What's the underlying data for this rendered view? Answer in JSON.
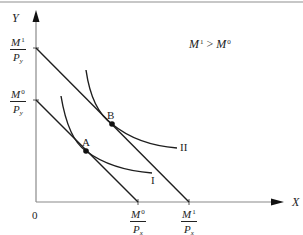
{
  "diagram": {
    "type": "indifference-curve budget-line diagram",
    "axes": {
      "x_label": "X",
      "y_label": "Y",
      "origin_label": "0"
    },
    "annotation": {
      "text_left": "M",
      "sup_left": "1",
      "relation": " > ",
      "text_right": "M",
      "sup_right": "0"
    },
    "y_intercepts": [
      {
        "num": "M",
        "num_sup": "0",
        "den": "P",
        "den_sub": "y"
      },
      {
        "num": "M",
        "num_sup": "1",
        "den": "P",
        "den_sub": "y"
      }
    ],
    "x_intercepts": [
      {
        "num": "M",
        "num_sup": "0",
        "den": "P",
        "den_sub": "x"
      },
      {
        "num": "M",
        "num_sup": "1",
        "den": "P",
        "den_sub": "x"
      }
    ],
    "points": [
      {
        "label": "A"
      },
      {
        "label": "B"
      }
    ],
    "curves": [
      {
        "label": "I"
      },
      {
        "label": "II"
      }
    ],
    "colors": {
      "axis": "#8a8a8a",
      "lines": "#1e1e1e",
      "top_rule": "#888888"
    }
  }
}
